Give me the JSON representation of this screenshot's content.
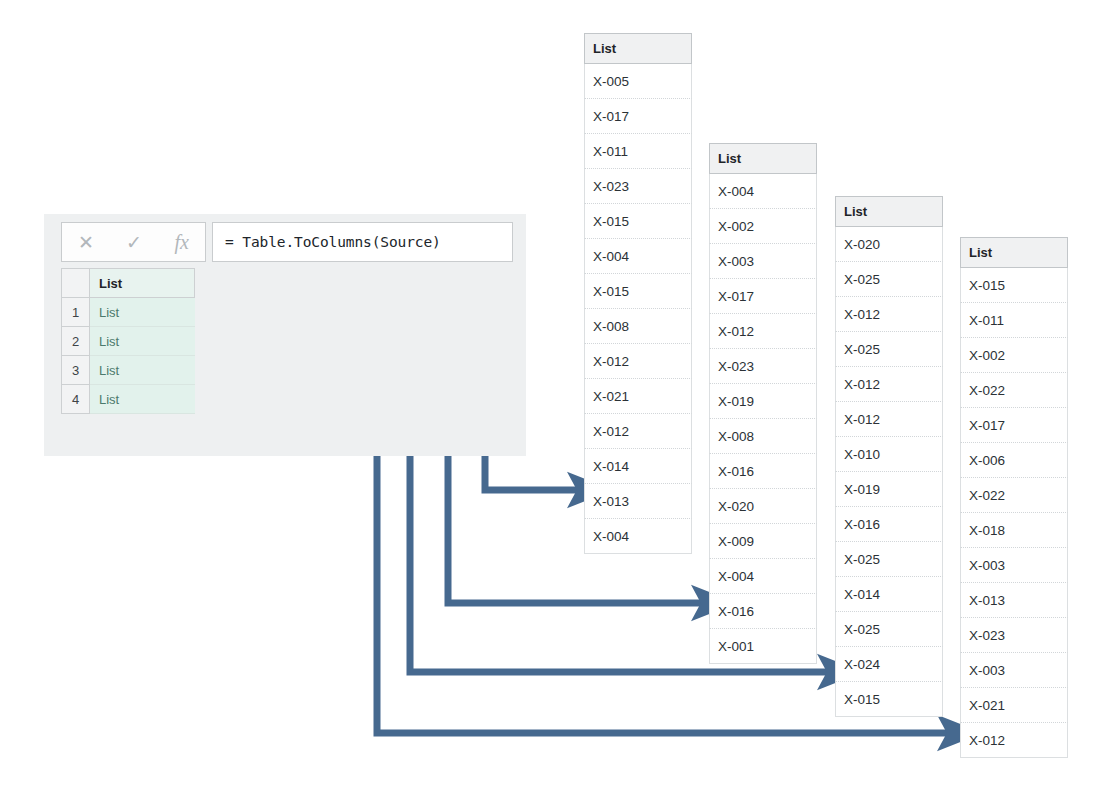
{
  "formula_bar": {
    "cancel_icon": "cancel-x-icon",
    "accept_icon": "checkmark-icon",
    "fx_icon": "fx",
    "cancel_glyph": "✕",
    "accept_glyph": "✓",
    "formula": "= Table.ToColumns(Source)"
  },
  "preview_grid": {
    "column_header": "List",
    "rows": [
      {
        "index": "1",
        "value": "List"
      },
      {
        "index": "2",
        "value": "List"
      },
      {
        "index": "3",
        "value": "List"
      },
      {
        "index": "4",
        "value": "List"
      }
    ]
  },
  "lists": [
    {
      "header": "List",
      "items": [
        "X-005",
        "X-017",
        "X-011",
        "X-023",
        "X-015",
        "X-004",
        "X-015",
        "X-008",
        "X-012",
        "X-021",
        "X-012",
        "X-014",
        "X-013",
        "X-004"
      ]
    },
    {
      "header": "List",
      "items": [
        "X-004",
        "X-002",
        "X-003",
        "X-017",
        "X-012",
        "X-023",
        "X-019",
        "X-008",
        "X-016",
        "X-020",
        "X-009",
        "X-004",
        "X-016",
        "X-001"
      ]
    },
    {
      "header": "List",
      "items": [
        "X-020",
        "X-025",
        "X-012",
        "X-025",
        "X-012",
        "X-012",
        "X-010",
        "X-019",
        "X-016",
        "X-025",
        "X-014",
        "X-025",
        "X-024",
        "X-015"
      ]
    },
    {
      "header": "List",
      "items": [
        "X-015",
        "X-011",
        "X-002",
        "X-022",
        "X-017",
        "X-006",
        "X-022",
        "X-018",
        "X-003",
        "X-013",
        "X-023",
        "X-003",
        "X-021",
        "X-012"
      ]
    }
  ],
  "connectors": {
    "color": "#46698f",
    "description": "Four elbow arrows from preview grid rows to the four expanded list cards",
    "arrows": [
      {
        "from_row": "1",
        "to_list": "1"
      },
      {
        "from_row": "2",
        "to_list": "2"
      },
      {
        "from_row": "3",
        "to_list": "3"
      },
      {
        "from_row": "4",
        "to_list": "4"
      }
    ]
  },
  "colors": {
    "accent": "#46698f",
    "panel_bg": "#eef0f1",
    "value_cell_bg": "#e2f2ec",
    "value_text": "#4c7a6d"
  }
}
